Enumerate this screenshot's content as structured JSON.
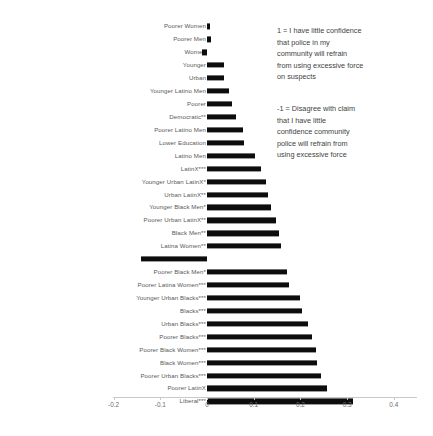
{
  "chart_data": {
    "type": "bar",
    "orientation": "horizontal",
    "title": "",
    "subtitle": "",
    "xlabel": "",
    "ylabel": "",
    "xlim": [
      -0.235,
      0.45
    ],
    "xticks": [
      -0.2,
      -0.1,
      0,
      0.1,
      0.2,
      0.3,
      0.4
    ],
    "xticklabels": [
      "-0.2",
      "-0.1",
      "0",
      "0.1",
      "0.2",
      "0.3",
      "0.4"
    ],
    "grid": false,
    "legend": "none",
    "bar_color": "#0d0d0d",
    "zero_reference": 0,
    "categories": [
      "Poorer Women",
      "Poorer Men",
      "Women",
      "Younger",
      "Urban",
      "Younger Latino Men",
      "Poorer",
      "Democratic**",
      "Poorer Latino Men",
      "Lower Education",
      "Latino Men",
      "LatinX***",
      "Younger Urban LatinX*",
      "Urban LatinX**",
      "Younger Black Men*",
      "Poorer Urban LatinX**",
      "Black Men**",
      "Latina Women**",
      "White***",
      "Poorer Black Men*",
      "Poorer Latina Women***",
      "Younger Urban Blacks***",
      "Blacks***",
      "Urban Blacks***",
      "Poorer Blacks***",
      "Poorer Black Women***",
      "Black Women***",
      "Poorer Urban Blacks***",
      "Poorer LatinX",
      "Liberal***"
    ],
    "values": [
      0.006,
      0.009,
      -0.011,
      0.036,
      0.036,
      0.047,
      0.054,
      0.062,
      0.077,
      0.079,
      0.103,
      0.116,
      0.126,
      0.13,
      0.137,
      0.147,
      0.155,
      0.158,
      -0.141,
      0.172,
      0.175,
      0.2,
      0.203,
      0.217,
      0.224,
      0.234,
      0.235,
      0.245,
      0.257,
      0.313
    ],
    "annotations": [
      {
        "id": "note-pos",
        "text": "1 = I have little confidence\nthat police in my\ncommunity will refrain\nfrom using excessive force\non suspects"
      },
      {
        "id": "note-neg",
        "text": "-1 = Disagree with claim\nthat I have little\nconfidence community\npolice will refrain from\nusing excessive force"
      }
    ],
    "significance_legend_note": "Asterisks in category labels denote statistical significance levels (*, **, ***)."
  }
}
